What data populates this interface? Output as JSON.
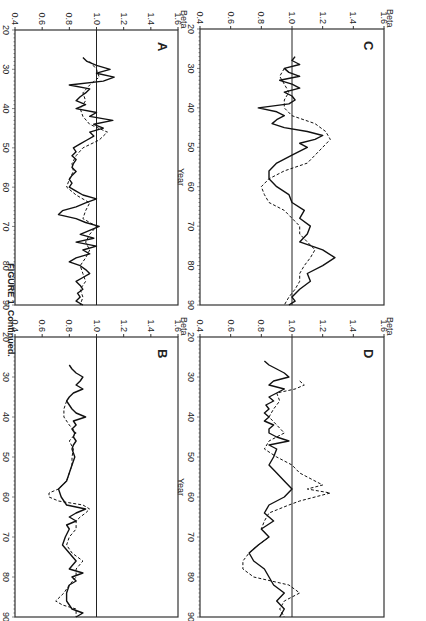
{
  "figure": {
    "caption": "FIGURE 1.  Continued.",
    "orientation": "rotated 90° clockwise"
  },
  "axes": {
    "ylabel": "Beta",
    "xlabel": "Year",
    "yticks": [
      "1.6",
      "1.4",
      "1.2",
      "1.0",
      "0.8",
      "0.6",
      "0.4"
    ],
    "xticks": [
      "20",
      "30",
      "40",
      "50",
      "60",
      "70",
      "80",
      "90"
    ],
    "ylim": [
      0.4,
      1.6
    ],
    "xlim": [
      20,
      90
    ],
    "reference_line": 1.0
  },
  "chart_data": [
    {
      "panel": "A",
      "type": "line",
      "title": "A",
      "xlabel": "Year",
      "ylabel": "Beta",
      "xlim": [
        20,
        90
      ],
      "ylim": [
        0.4,
        1.6
      ],
      "hline": 1.0,
      "series": [
        {
          "name": "solid",
          "style": "solid",
          "x": [
            27,
            28,
            29,
            30,
            31,
            32,
            33,
            34,
            35,
            36,
            37,
            38,
            39,
            40,
            41,
            42,
            43,
            44,
            45,
            46,
            47,
            48,
            49,
            50,
            51,
            52,
            53,
            54,
            55,
            56,
            57,
            58,
            59,
            60,
            61,
            62,
            63,
            64,
            65,
            66,
            67,
            68,
            69,
            70,
            71,
            72,
            73,
            74,
            75,
            76,
            77,
            78,
            79,
            80,
            81,
            82,
            83,
            84,
            85,
            86,
            87,
            88,
            89,
            90
          ],
          "values": [
            0.9,
            0.93,
            1.0,
            1.1,
            1.0,
            1.13,
            1.05,
            0.8,
            0.95,
            0.92,
            0.88,
            0.85,
            0.92,
            0.85,
            1.0,
            0.95,
            1.12,
            0.98,
            1.05,
            0.95,
            0.98,
            0.93,
            0.88,
            0.83,
            0.85,
            0.82,
            0.85,
            0.83,
            0.82,
            0.85,
            0.82,
            0.8,
            0.82,
            0.8,
            0.85,
            0.9,
            1.0,
            0.92,
            0.85,
            0.75,
            0.72,
            0.85,
            0.92,
            1.02,
            0.95,
            0.88,
            0.98,
            0.85,
            1.0,
            0.9,
            0.95,
            0.85,
            0.8,
            0.88,
            0.92,
            0.95,
            0.9,
            0.85,
            0.88,
            0.9,
            0.86,
            0.88,
            0.85,
            0.9
          ]
        },
        {
          "name": "dashed",
          "style": "dashed",
          "x": [
            28,
            30,
            32,
            34,
            36,
            38,
            40,
            42,
            44,
            46,
            48,
            50,
            52,
            54,
            56,
            58,
            60,
            62,
            64,
            66,
            68,
            70,
            72,
            74,
            76,
            78,
            80,
            82,
            84,
            86,
            88,
            90
          ],
          "values": [
            0.95,
            1.0,
            1.02,
            0.95,
            0.9,
            0.92,
            0.88,
            0.9,
            0.95,
            1.08,
            1.02,
            0.9,
            0.85,
            0.82,
            0.83,
            0.8,
            0.78,
            0.85,
            0.95,
            0.92,
            0.9,
            1.0,
            0.95,
            0.92,
            0.95,
            0.92,
            0.88,
            0.9,
            0.92,
            0.88,
            0.9,
            0.88
          ]
        }
      ]
    },
    {
      "panel": "B",
      "type": "line",
      "title": "B",
      "xlabel": "Year",
      "ylabel": "Beta",
      "xlim": [
        20,
        90
      ],
      "ylim": [
        0.4,
        1.6
      ],
      "hline": 1.0,
      "series": [
        {
          "name": "solid",
          "style": "solid",
          "x": [
            27,
            28,
            29,
            30,
            31,
            32,
            33,
            34,
            35,
            36,
            37,
            38,
            39,
            40,
            41,
            42,
            43,
            44,
            45,
            46,
            47,
            48,
            50,
            52,
            54,
            56,
            58,
            60,
            62,
            63,
            64,
            65,
            66,
            67,
            68,
            70,
            72,
            74,
            76,
            78,
            79,
            80,
            81,
            82,
            84,
            86,
            88,
            89,
            90
          ],
          "values": [
            0.8,
            0.82,
            0.85,
            0.9,
            0.88,
            0.85,
            0.9,
            0.83,
            0.8,
            0.78,
            0.8,
            0.82,
            0.85,
            0.92,
            0.83,
            0.85,
            0.82,
            0.84,
            0.83,
            0.85,
            0.83,
            0.82,
            0.84,
            0.82,
            0.8,
            0.78,
            0.72,
            0.74,
            0.78,
            0.92,
            0.85,
            0.8,
            0.85,
            0.78,
            0.8,
            0.77,
            0.75,
            0.8,
            0.85,
            0.8,
            0.9,
            0.82,
            0.85,
            0.8,
            0.78,
            0.78,
            0.82,
            0.9,
            0.85
          ]
        },
        {
          "name": "dashed",
          "style": "dashed",
          "x": [
            36,
            38,
            40,
            42,
            44,
            46,
            48,
            50,
            52,
            54,
            56,
            58,
            59,
            60,
            61,
            62,
            63,
            64,
            65,
            66,
            68,
            70,
            72,
            74,
            76,
            78,
            80,
            82,
            84,
            86,
            87,
            88,
            90
          ],
          "values": [
            0.78,
            0.76,
            0.76,
            0.8,
            0.85,
            0.8,
            0.83,
            0.82,
            0.82,
            0.8,
            0.78,
            0.72,
            0.65,
            0.65,
            0.72,
            0.9,
            0.95,
            0.92,
            0.88,
            0.85,
            0.85,
            0.8,
            0.78,
            0.82,
            0.9,
            0.85,
            0.85,
            0.8,
            0.76,
            0.7,
            0.75,
            0.85,
            0.85
          ]
        }
      ]
    },
    {
      "panel": "C",
      "type": "line",
      "title": "C",
      "xlabel": "Year",
      "ylabel": "Beta",
      "xlim": [
        20,
        90
      ],
      "ylim": [
        0.4,
        1.6
      ],
      "hline": 1.0,
      "series": [
        {
          "name": "solid",
          "style": "solid",
          "x": [
            27,
            28,
            29,
            30,
            31,
            32,
            33,
            34,
            35,
            36,
            37,
            38,
            39,
            40,
            41,
            42,
            43,
            44,
            45,
            46,
            47,
            48,
            49,
            50,
            52,
            54,
            56,
            58,
            60,
            62,
            64,
            66,
            68,
            70,
            72,
            74,
            76,
            78,
            80,
            82,
            84,
            86,
            88,
            89,
            90
          ],
          "values": [
            1.02,
            1.0,
            1.05,
            0.95,
            0.98,
            1.05,
            0.92,
            1.0,
            1.05,
            0.95,
            1.0,
            1.02,
            0.98,
            0.78,
            0.9,
            0.95,
            0.9,
            0.87,
            0.95,
            1.1,
            1.2,
            1.15,
            1.05,
            1.1,
            1.0,
            0.9,
            0.85,
            0.85,
            0.9,
            0.98,
            1.0,
            1.08,
            1.05,
            1.12,
            1.1,
            1.05,
            1.2,
            1.28,
            1.2,
            1.1,
            1.12,
            1.05,
            1.0,
            1.02,
            0.98
          ]
        },
        {
          "name": "dashed",
          "style": "dashed",
          "x": [
            30,
            32,
            34,
            36,
            38,
            40,
            42,
            44,
            46,
            48,
            50,
            52,
            54,
            56,
            58,
            60,
            62,
            64,
            66,
            68,
            70,
            72,
            74,
            76,
            78,
            80,
            82,
            84,
            86,
            88,
            90
          ],
          "values": [
            0.95,
            0.92,
            0.95,
            0.98,
            0.95,
            0.95,
            1.0,
            1.15,
            1.22,
            1.25,
            1.2,
            1.15,
            1.1,
            0.95,
            0.85,
            0.8,
            0.82,
            0.85,
            0.95,
            1.0,
            1.05,
            1.05,
            1.1,
            1.15,
            1.12,
            1.08,
            1.05,
            1.05,
            1.02,
            0.98,
            0.95
          ]
        }
      ]
    },
    {
      "panel": "D",
      "type": "line",
      "title": "D",
      "xlabel": "Year",
      "ylabel": "Beta",
      "xlim": [
        20,
        90
      ],
      "ylim": [
        0.4,
        1.6
      ],
      "hline": 1.0,
      "series": [
        {
          "name": "solid",
          "style": "solid",
          "x": [
            26,
            27,
            28,
            29,
            30,
            31,
            32,
            33,
            34,
            35,
            36,
            37,
            38,
            39,
            40,
            41,
            42,
            43,
            44,
            45,
            46,
            47,
            48,
            50,
            52,
            54,
            56,
            58,
            60,
            62,
            64,
            66,
            68,
            70,
            72,
            74,
            76,
            78,
            80,
            82,
            84,
            86,
            88,
            90
          ],
          "values": [
            0.82,
            0.85,
            0.9,
            0.95,
            0.98,
            0.88,
            0.85,
            0.95,
            0.9,
            0.85,
            0.88,
            0.83,
            0.85,
            0.82,
            0.85,
            0.82,
            0.88,
            0.85,
            0.85,
            0.9,
            0.98,
            0.85,
            0.9,
            0.88,
            0.85,
            0.9,
            0.95,
            1.0,
            0.95,
            0.85,
            0.82,
            0.88,
            0.8,
            0.85,
            0.78,
            0.72,
            0.75,
            0.82,
            0.85,
            0.88,
            0.95,
            0.9,
            0.95,
            0.92
          ]
        },
        {
          "name": "dashed",
          "style": "dashed",
          "x": [
            31,
            32,
            33,
            34,
            36,
            38,
            40,
            42,
            44,
            46,
            48,
            50,
            52,
            54,
            56,
            57,
            58,
            59,
            60,
            61,
            62,
            64,
            66,
            68,
            70,
            72,
            74,
            76,
            78,
            80,
            82,
            84,
            86,
            88,
            90
          ],
          "values": [
            1.05,
            1.08,
            1.02,
            0.9,
            0.92,
            0.88,
            0.85,
            0.9,
            0.95,
            0.85,
            0.82,
            0.9,
            1.0,
            1.05,
            1.15,
            1.2,
            1.1,
            1.25,
            1.15,
            1.05,
            0.98,
            0.85,
            0.82,
            0.8,
            0.85,
            0.78,
            0.72,
            0.68,
            0.68,
            0.75,
            0.98,
            1.05,
            0.95,
            0.92,
            0.95
          ]
        }
      ]
    }
  ]
}
